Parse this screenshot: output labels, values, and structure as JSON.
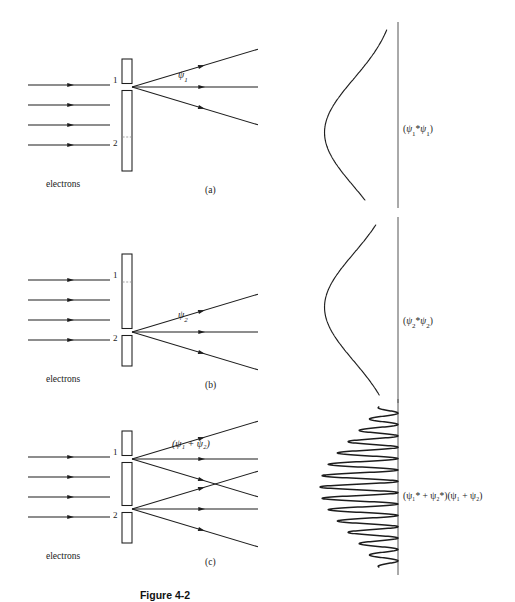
{
  "figure": {
    "caption": "Figure 4-2",
    "beam_label": "electrons",
    "slit_labels": {
      "top": "1",
      "bottom": "2"
    }
  },
  "panels": [
    {
      "id": "a",
      "panel_label": "(a)",
      "beam_label": "electrons",
      "slit_top_label": "1",
      "slit_bottom_label": "2",
      "open_slit": "top",
      "wave_label": "ψ",
      "wave_sub": "1",
      "probability_label": "(ψ₁*ψ₁)",
      "probability_parts": {
        "open": "(",
        "a": "ψ",
        "asub": "1",
        "star": "*",
        "b": "ψ",
        "bsub": "1",
        "close": ")"
      }
    },
    {
      "id": "b",
      "panel_label": "(b)",
      "beam_label": "electrons",
      "slit_top_label": "1",
      "slit_bottom_label": "2",
      "open_slit": "bottom",
      "wave_label": "ψ",
      "wave_sub": "2",
      "probability_label": "(ψ₂*ψ₂)",
      "probability_parts": {
        "open": "(",
        "a": "ψ",
        "asub": "2",
        "star": "*",
        "b": "ψ",
        "bsub": "2",
        "close": ")"
      }
    },
    {
      "id": "c",
      "panel_label": "(c)",
      "beam_label": "electrons",
      "slit_top_label": "1",
      "slit_bottom_label": "2",
      "open_slit": "both",
      "wave_label": "(ψ₁ + ψ₂)",
      "probability_label": "(ψ₁* + ψ₂*)(ψ₁ + ψ₂)"
    }
  ],
  "chart_data": [
    {
      "type": "line",
      "id": "intensity-single-slit-1",
      "title": "(ψ₁*ψ₁)",
      "xlabel": "",
      "ylabel": "position on screen",
      "orientation": "vertical-axis",
      "envelope": "single-gaussian",
      "peak_center": 0.56,
      "peak_amplitude": 1.0,
      "peak_width": 0.3,
      "secondary_shoulder": 0.22,
      "n_fringes": 0,
      "grid": false,
      "legend": false
    },
    {
      "type": "line",
      "id": "intensity-single-slit-2",
      "title": "(ψ₂*ψ₂)",
      "xlabel": "",
      "ylabel": "position on screen",
      "orientation": "vertical-axis",
      "envelope": "single-gaussian",
      "peak_center": 0.44,
      "peak_amplitude": 1.0,
      "peak_width": 0.3,
      "secondary_shoulder": 0.22,
      "n_fringes": 0,
      "grid": false,
      "legend": false
    },
    {
      "type": "line",
      "id": "intensity-interference",
      "title": "(ψ₁* + ψ₂*)(ψ₁ + ψ₂)",
      "xlabel": "",
      "ylabel": "position on screen",
      "orientation": "vertical-axis",
      "envelope": "gaussian",
      "peak_center": 0.5,
      "peak_amplitude": 1.0,
      "peak_width": 0.3,
      "n_fringes": 14,
      "fringe_period": 0.071,
      "grid": false,
      "legend": false
    }
  ],
  "geometry": {
    "beam_x_start": 28,
    "beam_x_end": 110,
    "beam_count": 4,
    "barrier_x": 122,
    "barrier_width": 10,
    "screen_x": 398,
    "ray_x_end": 258,
    "rays_per_fan": 3
  }
}
